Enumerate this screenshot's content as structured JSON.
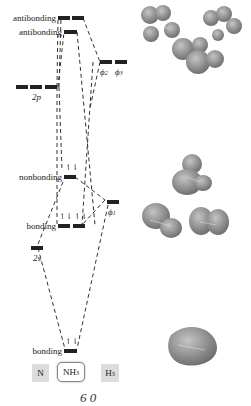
{
  "diagram": {
    "columns": {
      "left": "N",
      "center_main": "NH",
      "center_sub": "3",
      "right_main": "H",
      "right_sub": "3"
    },
    "levels": {
      "antibonding_upper": "antibonding",
      "antibonding_lower": "antibonding",
      "nonbonding": "nonbonding",
      "bonding_middle": "bonding",
      "bonding_bottom": "bonding",
      "n_2p": "2p",
      "n_2s": "2s",
      "phi1": "ϕ",
      "phi1_sub": "1",
      "phi2": "ϕ",
      "phi2_sub": "2",
      "phi3": "ϕ",
      "phi3_sub": "3"
    },
    "electrons": {
      "nonbonding": "↿⇂",
      "bonding_middle_1": "↿⇂",
      "bonding_middle_2": "↿⇂",
      "bonding_bottom": "↿⇂"
    },
    "footer_partial": "6    0",
    "colors": {
      "level_bar": "#222222",
      "dash_line": "#333333",
      "orbital_fill": "#8a8a8a",
      "label_box_gray": "#dcdcdc"
    }
  }
}
